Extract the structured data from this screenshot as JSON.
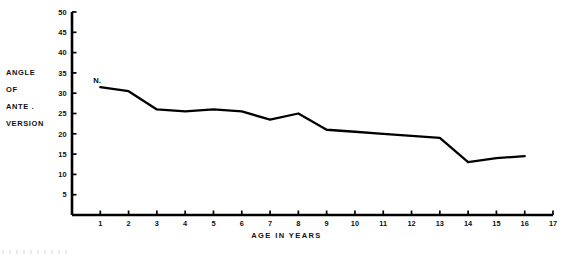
{
  "chart_data": {
    "type": "line",
    "title": "",
    "xlabel": "AGE IN YEARS",
    "ylabel": "ANGLE OF ANTE. VERSION",
    "ylabel_lines": [
      "ANGLE",
      "OF",
      "ANTE .",
      "VERSION"
    ],
    "xlim": [
      0,
      17
    ],
    "ylim": [
      0,
      50
    ],
    "grid": false,
    "legend": null,
    "xticks": [
      1,
      2,
      3,
      4,
      5,
      6,
      7,
      8,
      9,
      10,
      11,
      12,
      13,
      14,
      15,
      16,
      17
    ],
    "xtick_labels": [
      "1",
      "2",
      "3",
      "4",
      "5",
      "6",
      "7",
      "8",
      "9",
      "10",
      "11",
      "12",
      "13",
      "14",
      "15",
      "16",
      "17"
    ],
    "yticks": [
      5,
      10,
      15,
      20,
      25,
      30,
      35,
      40,
      45,
      50
    ],
    "ytick_labels": [
      "5",
      "10",
      "15",
      "20",
      "25",
      "30",
      "35",
      "40",
      "45",
      "50"
    ],
    "series": [
      {
        "name": "N",
        "marker_label": "N.",
        "color": "#000000",
        "x": [
          1,
          2,
          3,
          4,
          5,
          6,
          7,
          8,
          9,
          10,
          11,
          12,
          13,
          14,
          15,
          16
        ],
        "values": [
          31.5,
          30.5,
          26.0,
          25.5,
          26.0,
          25.5,
          23.5,
          25.0,
          21.0,
          20.5,
          20.0,
          19.5,
          19.0,
          13.0,
          14.0,
          14.5
        ]
      }
    ]
  }
}
